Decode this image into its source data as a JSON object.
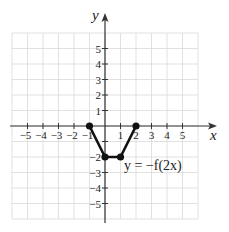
{
  "chart_data": {
    "type": "line",
    "title": "",
    "xlabel": "x",
    "ylabel": "y",
    "xlim": [
      -6,
      6
    ],
    "ylim": [
      -6,
      6
    ],
    "grid": true,
    "x_ticks": [
      -5,
      -4,
      -3,
      -2,
      -1,
      1,
      2,
      3,
      4,
      5
    ],
    "y_ticks": [
      -5,
      -4,
      -3,
      -2,
      -1,
      1,
      2,
      3,
      4,
      5
    ],
    "x_tick_labels": [
      "−5",
      "−4",
      "−3",
      "−2",
      "−1",
      "1",
      "2",
      "3",
      "4",
      "5"
    ],
    "y_tick_labels": [
      "−5",
      "−4",
      "−3",
      "−2",
      "−1",
      "1",
      "2",
      "3",
      "4",
      "5"
    ],
    "series": [
      {
        "name": "y = −f(2x)",
        "points": [
          [
            -1,
            0
          ],
          [
            0,
            -2
          ],
          [
            1,
            -2
          ],
          [
            2,
            0
          ]
        ],
        "markers": true,
        "color": "#111111"
      }
    ],
    "annotations": [
      {
        "text": "y = −f(2x)",
        "x": 1.2,
        "y": -2.8
      }
    ]
  },
  "style": {
    "grid_color": "#d9d9d9",
    "axis_color": "#333333",
    "curve_color": "#111111"
  }
}
